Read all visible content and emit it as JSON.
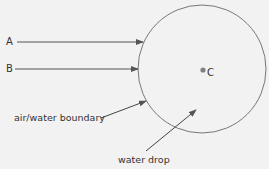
{
  "diagram": {
    "labels": {
      "a": "A",
      "b": "B",
      "c": "C",
      "boundary": "air/water boundary",
      "drop": "water drop"
    },
    "colors": {
      "line": "#555555",
      "circle": "#777777",
      "dot": "#808080",
      "background": "#f2f2f2"
    },
    "circle": {
      "cx": 202,
      "cy": 69,
      "r": 64
    }
  }
}
